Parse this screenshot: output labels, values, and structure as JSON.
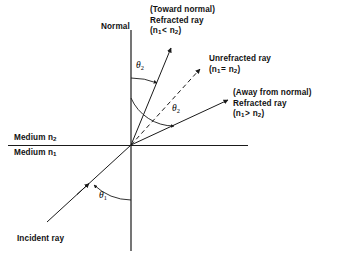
{
  "figure": {
    "background_color": "#ffffff",
    "line_color": "#1a1a1a",
    "axis": {
      "normal_label": "Normal",
      "origin": {
        "x": 131,
        "y": 145
      }
    },
    "media": {
      "upper_label": "Medium n",
      "upper_sub": "2",
      "lower_label": "Medium n",
      "lower_sub": "1"
    },
    "angles": [
      {
        "name": "theta-2-upper",
        "symbol": "θ",
        "sub": "2"
      },
      {
        "name": "theta-2-lower",
        "symbol": "θ",
        "sub": "2"
      },
      {
        "name": "theta-1",
        "symbol": "θ",
        "sub": "1"
      }
    ],
    "rays": {
      "incident": {
        "label": "Incident ray"
      },
      "toward_normal": {
        "line1": "(Toward normal)",
        "line2": "Refracted ray",
        "cond_open": "(n",
        "cond_sub1": "1",
        "cond_op": "<",
        "cond_n2": " n",
        "cond_sub2": "2",
        "cond_close": ")"
      },
      "unrefracted": {
        "line1": "Unrefracted ray",
        "cond_open": "(n",
        "cond_sub1": "1",
        "cond_op": "=",
        "cond_n2": " n",
        "cond_sub2": "2",
        "cond_close": ")"
      },
      "away_from_normal": {
        "line1": "(Away from normal)",
        "line2": "Refracted ray",
        "cond_open": "(n",
        "cond_sub1": "1",
        "cond_op": ">",
        "cond_n2": " n",
        "cond_sub2": "2",
        "cond_close": ")"
      }
    }
  }
}
